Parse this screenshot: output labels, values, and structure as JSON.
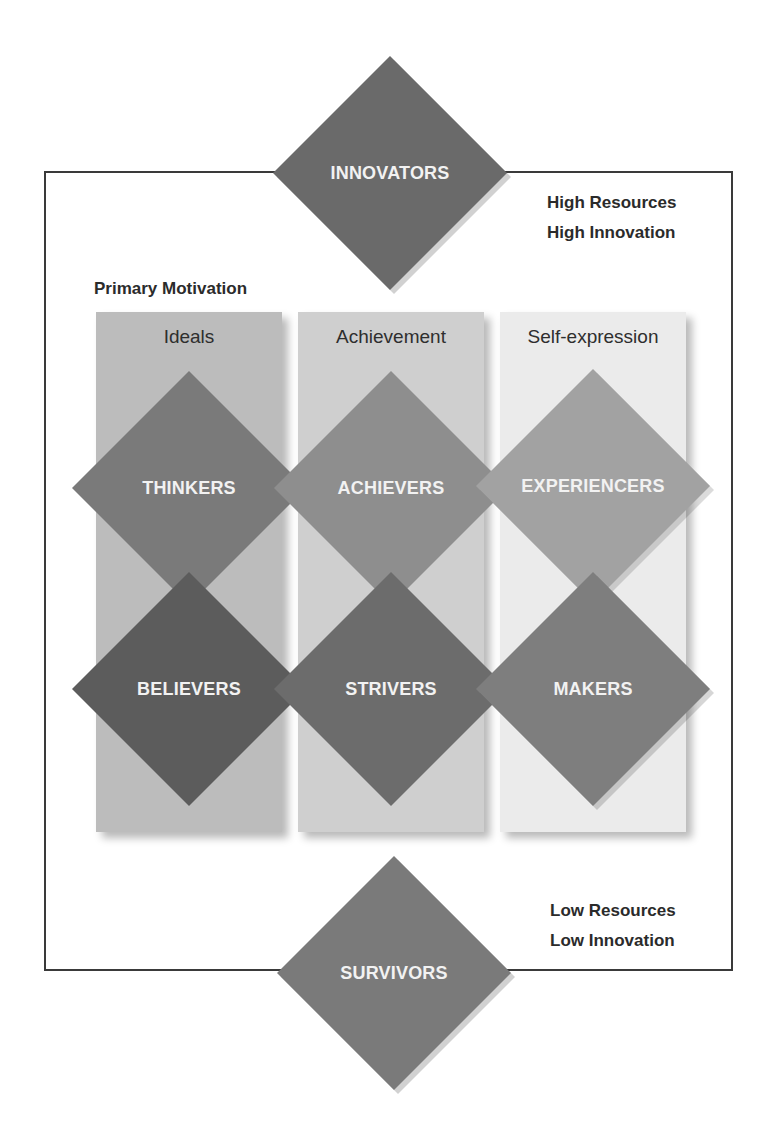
{
  "diagram": {
    "heading": "Primary Motivation",
    "top_note": [
      "High Resources",
      "High Innovation"
    ],
    "bottom_note": [
      "Low Resources",
      "Low Innovation"
    ],
    "columns": [
      {
        "label": "Ideals",
        "color": "#bcbcbc"
      },
      {
        "label": "Achievement",
        "color": "#cfcfcf"
      },
      {
        "label": "Self-expression",
        "color": "#ebebeb"
      }
    ],
    "segments": {
      "innovators": {
        "label": "INNOVATORS",
        "color": "#6a6a6a"
      },
      "thinkers": {
        "label": "THINKERS",
        "color": "#7a7a7a"
      },
      "achievers": {
        "label": "ACHIEVERS",
        "color": "#8e8e8e"
      },
      "experiencers": {
        "label": "EXPERIENCERS",
        "color": "#a2a2a2"
      },
      "believers": {
        "label": "BELIEVERS",
        "color": "#5c5c5c"
      },
      "strivers": {
        "label": "STRIVERS",
        "color": "#6c6c6c"
      },
      "makers": {
        "label": "MAKERS",
        "color": "#7e7e7e"
      },
      "survivors": {
        "label": "SURVIVORS",
        "color": "#7a7a7a"
      }
    }
  }
}
